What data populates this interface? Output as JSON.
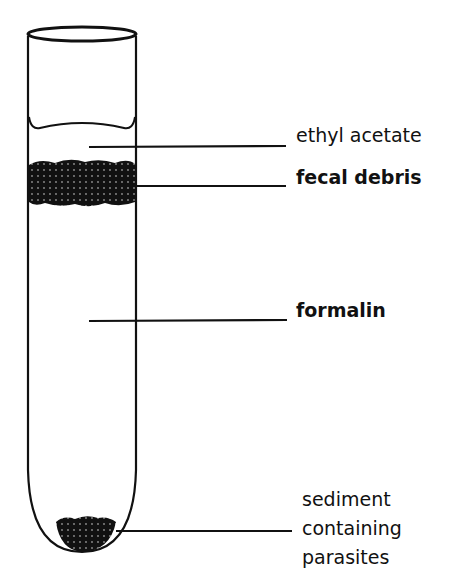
{
  "diagram": {
    "labels": [
      {
        "id": "ethyl-acetate",
        "text": "ethyl acetate"
      },
      {
        "id": "fecal-debris",
        "text": "fecal debris"
      },
      {
        "id": "formalin",
        "text": "formalin"
      },
      {
        "id": "sediment",
        "lines": [
          "sediment",
          "containing",
          "parasites"
        ]
      }
    ]
  }
}
